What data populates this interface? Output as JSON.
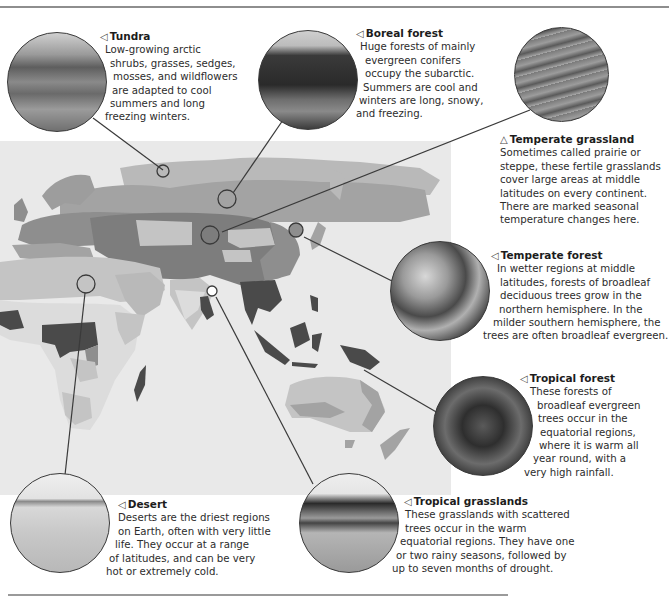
{
  "biomes": {
    "tundra": {
      "pointer": "◁",
      "title": "Tundra",
      "lines": [
        "Low-growing arctic",
        "shrubs, grasses, sedges,",
        "mosses, and wildflowers",
        "are adapted to cool",
        "summers and long",
        "freezing winters."
      ],
      "photo": "tundra-landscape"
    },
    "boreal_forest": {
      "pointer": "◁",
      "title": "Boreal forest",
      "lines": [
        "Huge forests of mainly",
        "evergreen conifers",
        "occupy the subarctic.",
        "Summers are cool and",
        "winters are long, snowy,",
        "and freezing."
      ],
      "photo": "conifer-forest"
    },
    "temperate_grassland": {
      "pointer": "△",
      "title": "Temperate grassland",
      "lines": [
        "Sometimes called prairie or",
        "steppe, these fertile grasslands",
        "cover large areas at middle",
        "latitudes on every continent.",
        "There are marked seasonal",
        "temperature changes here."
      ],
      "photo": "grassland-prairie"
    },
    "temperate_forest": {
      "pointer": "◁",
      "title": "Temperate forest",
      "lines": [
        "In wetter regions at middle",
        "latitudes, forests of broadleaf",
        "deciduous trees grow in the",
        "northern hemisphere. In the",
        "milder southern hemisphere, the",
        "trees are often broadleaf evergreen."
      ],
      "photo": "broadleaf-canopy"
    },
    "tropical_forest": {
      "pointer": "◁",
      "title": "Tropical forest",
      "lines": [
        "These forests of",
        "broadleaf evergreen",
        "trees occur in the",
        "equatorial regions,",
        "where it is warm all",
        "year round, with a",
        "very high rainfall."
      ],
      "photo": "rainforest-canopy"
    },
    "desert": {
      "pointer": "◁",
      "title": "Desert",
      "lines": [
        "Deserts are the driest regions",
        "on Earth, often with very little",
        "life. They occur at a range",
        "of latitudes, and can be very",
        "hot or extremely cold."
      ],
      "photo": "sand-dunes"
    },
    "tropical_grasslands": {
      "pointer": "◁",
      "title": "Tropical grasslands",
      "lines": [
        "These grasslands with scattered",
        "trees occur in the warm",
        "equatorial regions. They have one",
        "or two rainy seasons, followed by",
        "up to seven months of drought."
      ],
      "photo": "savanna-acacia"
    }
  },
  "colors": {
    "map_background": "#e9e9e9",
    "tundra": "#b9b9b9",
    "boreal": "#a3a3a3",
    "temperate_forest": "#8e8e8e",
    "temperate_grassland": "#7d7d7d",
    "desert": "#c4c4c4",
    "tropical_grassland": "#dcdcdc",
    "tropical_forest": "#4a4a4a",
    "leader_line": "#3a3a3a"
  }
}
